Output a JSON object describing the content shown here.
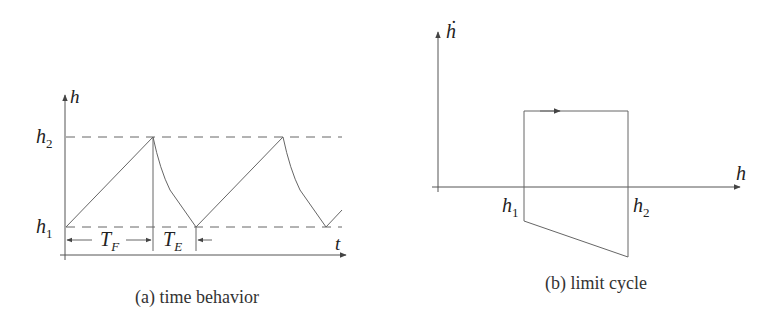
{
  "panel_a": {
    "caption": "(a) time behavior",
    "y_axis_label": "h",
    "x_axis_label": "t",
    "level_high": "h",
    "level_high_sub": "2",
    "level_low": "h",
    "level_low_sub": "1",
    "fill_interval": "T",
    "fill_interval_sub": "F",
    "empty_interval": "T",
    "empty_interval_sub": "E"
  },
  "panel_b": {
    "caption": "(b) limit cycle",
    "y_axis_label": "ḣ",
    "x_axis_label": "h",
    "left_level": "h",
    "left_level_sub": "1",
    "right_level": "h",
    "right_level_sub": "2"
  }
}
